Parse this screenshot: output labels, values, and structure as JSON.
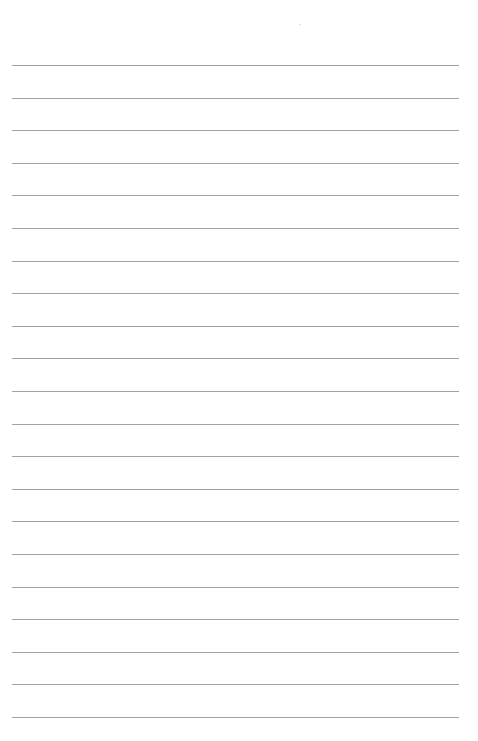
{
  "page": {
    "type": "lined-paper",
    "background_color": "#ffffff",
    "line_color": "#a3a3a3",
    "line_count": 21,
    "first_line_y": 65,
    "line_spacing": 32.6,
    "line_left": 12,
    "line_width": 447,
    "text": ""
  }
}
